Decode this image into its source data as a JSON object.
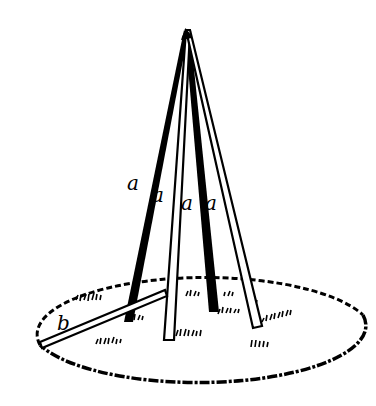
{
  "figure": {
    "labels": {
      "pole_1": "a",
      "pole_2": "a",
      "pole_3": "a",
      "pole_4": "a",
      "brace": "b"
    },
    "colors": {
      "ink": "#000000",
      "background": "#ffffff"
    }
  }
}
